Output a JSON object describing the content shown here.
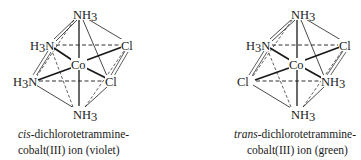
{
  "figure": {
    "left_molecule": {
      "name": "cis-dichlorotetrammine-cobalt(III) ion",
      "caption": {
        "prefix_italic": "cis",
        "line1_rest": "-dichlorotetrammine-",
        "line2": "cobalt(III) ion (violet)"
      },
      "atoms": {
        "center": "Co",
        "top": "NH3",
        "bottom": "NH3",
        "back_left": "H3N",
        "back_right": "Cl",
        "front_left": "H3N",
        "front_right": "Cl"
      },
      "color_note": "violet"
    },
    "right_molecule": {
      "name": "trans-dichlorotetrammine-cobalt(III) ion",
      "caption": {
        "prefix_italic": "trans",
        "line1_rest": "-dichlorotetrammine-",
        "line2": "cobalt(III) ion (green)"
      },
      "atoms": {
        "center": "Co",
        "top": "NH3",
        "bottom": "NH3",
        "back_left": "H3N",
        "back_right": "Cl",
        "front_left": "Cl",
        "front_right": "NH3"
      },
      "color_note": "green"
    }
  },
  "labels": {
    "Co": "Co",
    "N": "N",
    "H": "H",
    "Cl": "Cl",
    "sub3": "3"
  },
  "colors": {
    "ink": "#1a1a1a",
    "background": "#ffffff"
  }
}
